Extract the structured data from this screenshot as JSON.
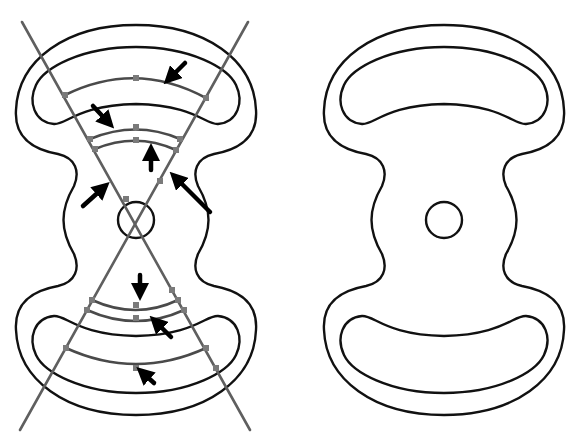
{
  "figure": {
    "panels": [
      {
        "id": "left",
        "description": "Dumbbell-shaped domain with two crossing guide lines through central circle, concentric arc segments and inward-pointing arrows"
      },
      {
        "id": "right",
        "description": "Same dumbbell-shaped domain without guides: outer boundary, two crescent holes and central circle"
      }
    ],
    "colors": {
      "outline": "#111111",
      "guide_line": "#5f5f5f",
      "arc": "#4a4a4a",
      "node": "#7a7a7a",
      "arrow": "#000000",
      "background": "#ffffff"
    },
    "left_panel": {
      "arrow_count": 8,
      "arc_count": 6,
      "guide_lines": 2
    }
  }
}
